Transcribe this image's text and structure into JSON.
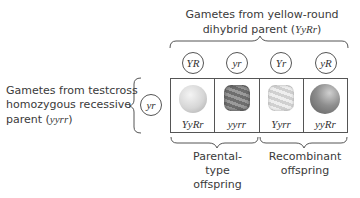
{
  "top_label": {
    "line1": "Gametes from yellow-round",
    "line2_prefix": "dihybrid parent (",
    "line2_genotype": "YyRr",
    "line2_suffix": ")"
  },
  "left_label": {
    "line1": "Gametes from testcross",
    "line2": "homozygous recessive",
    "line3_prefix": "parent (",
    "line3_genotype": "yyrr",
    "line3_suffix": ")"
  },
  "top_gametes": [
    "YR",
    "yr",
    "Yr",
    "yR"
  ],
  "left_gamete": "yr",
  "offspring": [
    {
      "genotype": "YyRr",
      "phenotype": "yellow-round",
      "color": "#d8d8d8",
      "shape": "round"
    },
    {
      "genotype": "yyrr",
      "phenotype": "green-wrinkled",
      "color": "#8a8a8a",
      "shape": "wrinkled"
    },
    {
      "genotype": "Yyrr",
      "phenotype": "yellow-wrinkled",
      "color": "#e4e4e4",
      "shape": "wrinkled"
    },
    {
      "genotype": "yyRr",
      "phenotype": "green-round",
      "color": "#8f8f8f",
      "shape": "round"
    }
  ],
  "bottom_labels": {
    "parental": [
      "Parental-",
      "type",
      "offspring"
    ],
    "recombinant": [
      "Recombinant",
      "offspring"
    ]
  },
  "colors": {
    "line": "#555555",
    "text": "#3a3a3a"
  }
}
